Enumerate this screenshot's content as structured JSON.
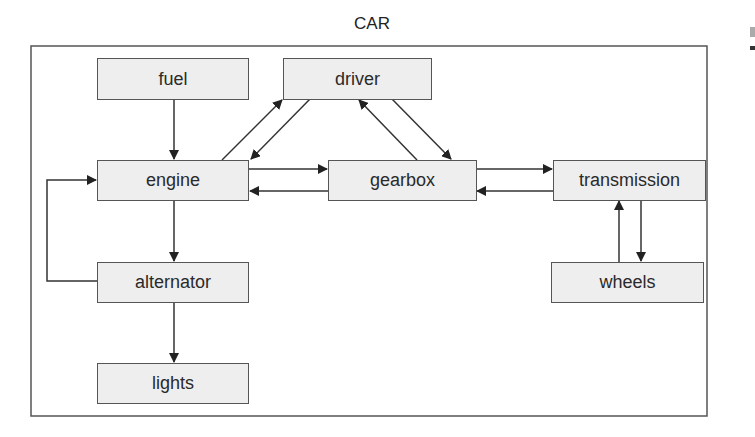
{
  "diagram": {
    "title": "CAR",
    "colors": {
      "node_fill": "#eeeeee",
      "node_border": "#555555",
      "frame": "#555555",
      "edge": "#333333",
      "text": "#2a2a2a"
    },
    "nodes": [
      {
        "id": "fuel",
        "label": "fuel"
      },
      {
        "id": "driver",
        "label": "driver"
      },
      {
        "id": "engine",
        "label": "engine"
      },
      {
        "id": "gearbox",
        "label": "gearbox"
      },
      {
        "id": "transmission",
        "label": "transmission"
      },
      {
        "id": "alternator",
        "label": "alternator"
      },
      {
        "id": "wheels",
        "label": "wheels"
      },
      {
        "id": "lights",
        "label": "lights"
      }
    ],
    "edges": [
      {
        "from": "fuel",
        "to": "engine"
      },
      {
        "from": "engine",
        "to": "driver"
      },
      {
        "from": "driver",
        "to": "engine"
      },
      {
        "from": "gearbox",
        "to": "driver"
      },
      {
        "from": "driver",
        "to": "gearbox"
      },
      {
        "from": "engine",
        "to": "gearbox"
      },
      {
        "from": "gearbox",
        "to": "engine"
      },
      {
        "from": "gearbox",
        "to": "transmission"
      },
      {
        "from": "transmission",
        "to": "gearbox"
      },
      {
        "from": "wheels",
        "to": "transmission"
      },
      {
        "from": "transmission",
        "to": "wheels"
      },
      {
        "from": "engine",
        "to": "alternator"
      },
      {
        "from": "alternator",
        "to": "engine"
      },
      {
        "from": "alternator",
        "to": "lights"
      }
    ]
  }
}
